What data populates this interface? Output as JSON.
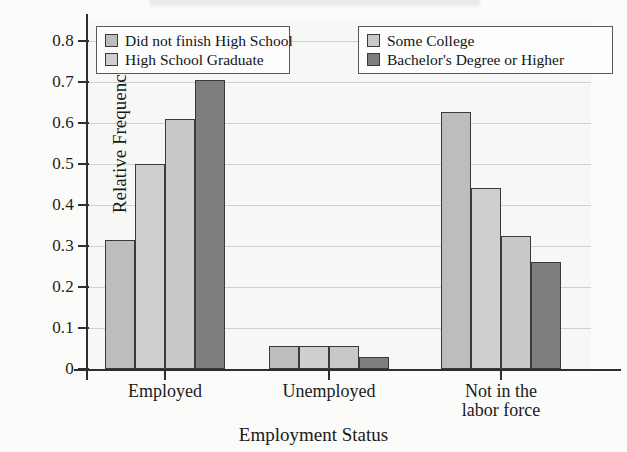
{
  "chart_data": {
    "type": "bar",
    "title": "",
    "xlabel": "Employment Status",
    "ylabel": "Relative Frequency",
    "categories": [
      "Employed",
      "Unemployed",
      "Not in the\nlabor force"
    ],
    "category_labels": [
      {
        "line1": "Employed",
        "line2": ""
      },
      {
        "line1": "Unemployed",
        "line2": ""
      },
      {
        "line1": "Not in the",
        "line2": "labor force"
      }
    ],
    "series": [
      {
        "name": "Did not finish High School",
        "color": "#bdbdbd",
        "values": [
          0.315,
          0.055,
          0.625
        ]
      },
      {
        "name": "High School Graduate",
        "color": "#cfcfcf",
        "values": [
          0.5,
          0.055,
          0.44
        ]
      },
      {
        "name": "Some College",
        "color": "#c8c8c8",
        "values": [
          0.61,
          0.055,
          0.325
        ]
      },
      {
        "name": "Bachelor's Degree or Higher",
        "color": "#7d7d7d",
        "values": [
          0.705,
          0.03,
          0.26
        ]
      }
    ],
    "ylim": [
      0,
      0.85
    ],
    "ytick_values": [
      0,
      0.1,
      0.2,
      0.3,
      0.4,
      0.5,
      0.6,
      0.7,
      0.8
    ],
    "ytick_labels": [
      "0",
      "0.1",
      "0.2",
      "0.3",
      "0.4",
      "0.5",
      "0.6",
      "0.7",
      "0.8"
    ],
    "grid": true,
    "grid_axis": "y",
    "legend_position": "top-inside",
    "legend_columns": 2,
    "legend": [
      "Did not finish High School",
      "High School Graduate",
      "Some College",
      "Bachelor's Degree or Higher"
    ],
    "background_color": "#f7f7f6",
    "axis_color": "#2e2e2e",
    "gridline_color": "#c9c9c7",
    "bar_edge_color": "#3a3a3a"
  }
}
